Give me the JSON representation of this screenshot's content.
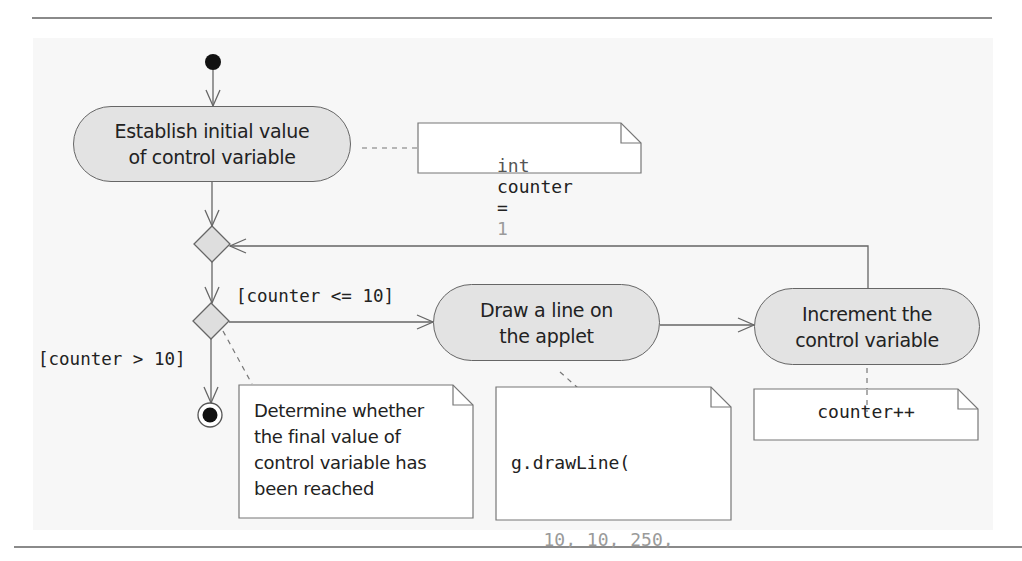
{
  "diagram": {
    "type": "UML activity diagram",
    "title": "",
    "nodes": {
      "initial": {
        "kind": "initial-node"
      },
      "activity_init": {
        "kind": "action",
        "lines": [
          "Establish initial value",
          "of control variable"
        ]
      },
      "merge": {
        "kind": "merge-node"
      },
      "decision": {
        "kind": "decision-node"
      },
      "activity_draw": {
        "kind": "action",
        "lines": [
          "Draw a line on",
          "the applet"
        ]
      },
      "activity_increment": {
        "kind": "action",
        "lines": [
          "Increment the",
          "control variable"
        ]
      },
      "final": {
        "kind": "final-node"
      }
    },
    "guards": {
      "loop_continue": "[counter <= 10]",
      "loop_exit": "[counter > 10]"
    },
    "notes": {
      "init_note": {
        "keyword": "int",
        "identifier": "counter",
        "operator": "=",
        "value": "1"
      },
      "decision_note": {
        "lines": [
          "Determine whether",
          "the final value of",
          "control variable has",
          "been reached"
        ]
      },
      "draw_note": {
        "line1": "g.drawLine(",
        "args1": "10, 10, 250,",
        "arg2_identifier": "counter",
        "arg2_operator": "*",
        "arg2_value": "10",
        "line_end": ");"
      },
      "increment_note": {
        "text": "counter++"
      }
    },
    "colors": {
      "action_fill": "#e3e3e3",
      "node_stroke": "#666666",
      "note_fill": "#ffffff",
      "literal_gray": "#9a9a9a",
      "panel_bg": "#f7f7f7"
    }
  }
}
